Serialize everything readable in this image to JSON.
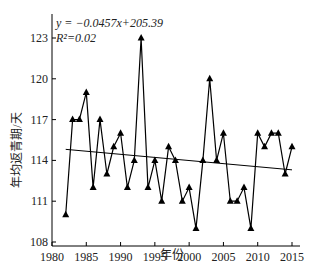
{
  "chart_data": {
    "type": "line",
    "title": "",
    "xlabel": "年份",
    "ylabel": "年均返青期/天",
    "xlim": [
      1980,
      2016
    ],
    "ylim": [
      108,
      124.5
    ],
    "xticks": [
      1980,
      1985,
      1990,
      1995,
      2000,
      2005,
      2010,
      2015
    ],
    "yticks": [
      108,
      111,
      114,
      117,
      120,
      123
    ],
    "grid": false,
    "annotations": {
      "equation": "y = −0.0457x+205.39",
      "r2": "R²=0.02"
    },
    "series": [
      {
        "name": "年均返青期",
        "marker": "triangle",
        "color": "#000000",
        "x": [
          1982,
          1983,
          1984,
          1985,
          1986,
          1987,
          1988,
          1989,
          1990,
          1991,
          1992,
          1993,
          1994,
          1995,
          1996,
          1997,
          1998,
          1999,
          2000,
          2001,
          2002,
          2003,
          2004,
          2005,
          2006,
          2007,
          2008,
          2009,
          2010,
          2011,
          2012,
          2013,
          2014,
          2015
        ],
        "values": [
          110,
          117,
          117,
          119,
          112,
          117,
          113,
          115,
          116,
          112,
          114,
          123,
          112,
          114,
          111,
          115,
          114,
          111,
          112,
          109,
          114,
          120,
          114,
          116,
          111,
          111,
          112,
          109,
          116,
          115,
          116,
          116,
          113,
          115
        ]
      },
      {
        "name": "trend",
        "type": "line",
        "color": "#000000",
        "slope": -0.0457,
        "intercept": 205.39,
        "x_range": [
          1982,
          2015
        ]
      }
    ]
  }
}
